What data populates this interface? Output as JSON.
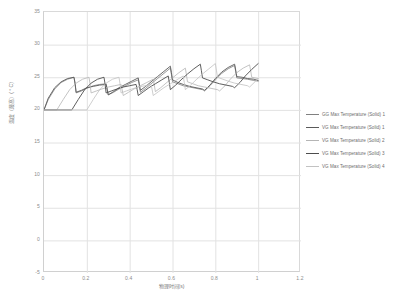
{
  "chart_data": {
    "type": "line",
    "title": "",
    "xlabel": "物理时间(s)",
    "ylabel": "温度（最高）( ° C)",
    "xlim": [
      0,
      1.2
    ],
    "ylim": [
      -5,
      35
    ],
    "xticks": [
      "0",
      "0.2",
      "0.4",
      "0.6",
      "0.8",
      "1",
      "1.2"
    ],
    "yticks": [
      "35",
      "30",
      "25",
      "20",
      "15",
      "10",
      "5",
      "0",
      "-5"
    ],
    "grid": true,
    "legend_position": "right",
    "series": [
      {
        "name": "GG Max Temperature (Solid) 1",
        "color": "#808080",
        "width": 0.8,
        "x": [
          0.0,
          0.02,
          0.05,
          0.08,
          0.11,
          0.14,
          0.145,
          0.15,
          0.175,
          0.2,
          0.23,
          0.26,
          0.29,
          0.295,
          0.3,
          0.325,
          0.35,
          0.38,
          0.41,
          0.44,
          0.445,
          0.45,
          0.475,
          0.5,
          0.53,
          0.56,
          0.59,
          0.595,
          0.6,
          0.625,
          0.65,
          0.68,
          0.71,
          0.74,
          0.745,
          0.75,
          0.775,
          0.8,
          0.83,
          0.86,
          0.89,
          0.895,
          0.9,
          0.925,
          0.95,
          0.98,
          1.0
        ],
        "y": [
          20.0,
          21.6,
          23.2,
          24.2,
          24.7,
          25.0,
          24.0,
          22.6,
          22.9,
          23.3,
          23.7,
          23.9,
          24.0,
          23.2,
          22.3,
          22.7,
          23.2,
          23.7,
          24.2,
          24.6,
          23.7,
          22.7,
          23.3,
          24.0,
          24.8,
          25.6,
          26.4,
          25.4,
          24.3,
          24.0,
          23.7,
          23.5,
          23.3,
          23.1,
          23.0,
          22.9,
          23.7,
          24.6,
          25.6,
          26.3,
          26.8,
          25.9,
          24.9,
          24.8,
          24.7,
          24.5,
          24.4
        ]
      },
      {
        "name": "VG Max Temperature (Solid) 1",
        "color": "#5a5a5a",
        "width": 0.9,
        "x": [
          0.0,
          0.02,
          0.05,
          0.08,
          0.11,
          0.14,
          0.145,
          0.15,
          0.175,
          0.2,
          0.23,
          0.26,
          0.29,
          0.295,
          0.3,
          0.325,
          0.35,
          0.38,
          0.41,
          0.44,
          0.445,
          0.45,
          0.475,
          0.5,
          0.53,
          0.56,
          0.59,
          0.595,
          0.6,
          0.625,
          0.65,
          0.68,
          0.71,
          0.74,
          0.745,
          0.75,
          0.775,
          0.8,
          0.83,
          0.86,
          0.89,
          0.895,
          0.9,
          0.925,
          0.95,
          0.98,
          1.0
        ],
        "y": [
          20.0,
          21.8,
          23.4,
          24.3,
          24.8,
          25.0,
          24.1,
          22.7,
          23.0,
          23.4,
          23.6,
          23.8,
          23.9,
          23.1,
          22.3,
          22.8,
          23.4,
          23.9,
          24.4,
          24.9,
          24.0,
          23.0,
          23.6,
          24.3,
          25.1,
          25.9,
          26.7,
          25.7,
          24.6,
          24.2,
          23.9,
          23.6,
          23.4,
          23.2,
          23.1,
          23.0,
          23.8,
          24.8,
          25.8,
          26.5,
          27.0,
          26.1,
          25.1,
          25.0,
          24.8,
          24.7,
          24.5
        ]
      },
      {
        "name": "VG Max Temperature (Solid) 2",
        "color": "#b5b5b5",
        "width": 0.8,
        "x": [
          0.0,
          0.06,
          0.09,
          0.12,
          0.15,
          0.18,
          0.21,
          0.215,
          0.22,
          0.245,
          0.27,
          0.3,
          0.33,
          0.36,
          0.365,
          0.37,
          0.395,
          0.42,
          0.45,
          0.48,
          0.51,
          0.515,
          0.52,
          0.545,
          0.57,
          0.6,
          0.63,
          0.66,
          0.665,
          0.67,
          0.695,
          0.72,
          0.75,
          0.78,
          0.81,
          0.815,
          0.82,
          0.845,
          0.87,
          0.9,
          0.93,
          0.96,
          0.965,
          0.97,
          1.0
        ],
        "y": [
          20.0,
          20.0,
          21.6,
          23.1,
          24.1,
          24.7,
          25.0,
          24.0,
          22.6,
          22.9,
          23.2,
          23.5,
          23.7,
          23.9,
          23.1,
          22.2,
          22.7,
          23.2,
          23.7,
          24.2,
          24.7,
          23.8,
          22.8,
          23.4,
          24.1,
          24.9,
          25.7,
          26.4,
          25.4,
          24.3,
          24.0,
          23.7,
          23.5,
          23.3,
          23.1,
          23.0,
          22.9,
          23.7,
          24.7,
          25.7,
          26.4,
          26.9,
          26.0,
          25.0,
          24.8
        ]
      },
      {
        "name": "VG Max Temperature (Solid) 3",
        "color": "#4d4d4d",
        "width": 0.9,
        "x": [
          0.0,
          0.13,
          0.16,
          0.19,
          0.22,
          0.25,
          0.28,
          0.285,
          0.29,
          0.315,
          0.34,
          0.37,
          0.4,
          0.43,
          0.435,
          0.44,
          0.465,
          0.49,
          0.52,
          0.55,
          0.58,
          0.585,
          0.59,
          0.615,
          0.64,
          0.67,
          0.7,
          0.73,
          0.735,
          0.74,
          0.765,
          0.79,
          0.82,
          0.85,
          0.88,
          0.885,
          0.89,
          0.915,
          0.94,
          0.97,
          1.0
        ],
        "y": [
          20.0,
          20.0,
          21.6,
          23.1,
          24.1,
          24.7,
          25.0,
          24.0,
          22.6,
          22.9,
          23.2,
          23.5,
          23.7,
          23.9,
          23.1,
          22.2,
          22.8,
          23.4,
          24.0,
          24.6,
          25.2,
          24.2,
          23.1,
          23.8,
          24.6,
          25.5,
          26.3,
          27.0,
          26.0,
          24.9,
          24.6,
          24.3,
          24.0,
          23.8,
          23.6,
          23.5,
          23.4,
          24.2,
          25.2,
          26.2,
          27.1
        ]
      },
      {
        "name": "VG Max Temperature (Solid) 4",
        "color": "#c2c2c2",
        "width": 0.8,
        "x": [
          0.0,
          0.2,
          0.23,
          0.26,
          0.29,
          0.32,
          0.35,
          0.355,
          0.36,
          0.385,
          0.41,
          0.44,
          0.47,
          0.5,
          0.505,
          0.51,
          0.535,
          0.56,
          0.59,
          0.62,
          0.65,
          0.655,
          0.66,
          0.685,
          0.71,
          0.74,
          0.77,
          0.8,
          0.805,
          0.81,
          0.835,
          0.86,
          0.89,
          0.92,
          0.95,
          0.955,
          0.96,
          0.985,
          1.0
        ],
        "y": [
          20.0,
          20.0,
          21.6,
          23.1,
          24.1,
          24.7,
          25.0,
          24.0,
          22.6,
          22.9,
          23.2,
          23.5,
          23.7,
          23.9,
          23.1,
          22.2,
          22.8,
          23.4,
          24.0,
          24.6,
          25.2,
          24.2,
          23.1,
          23.8,
          24.6,
          25.5,
          26.3,
          27.1,
          26.1,
          25.0,
          24.7,
          24.4,
          24.1,
          23.9,
          23.7,
          23.6,
          23.5,
          24.3,
          24.8
        ]
      }
    ]
  },
  "legend": {
    "items": [
      {
        "label": "GG Max Temperature (Solid) 1"
      },
      {
        "label": "VG Max Temperature (Solid) 1"
      },
      {
        "label": "VG Max Temperature (Solid) 2"
      },
      {
        "label": "VG Max Temperature (Solid) 3"
      },
      {
        "label": "VG Max Temperature (Solid) 4"
      }
    ]
  }
}
